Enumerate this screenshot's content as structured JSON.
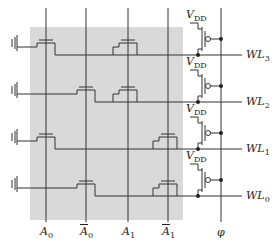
{
  "diagram": {
    "type": "NOR-based address decoder",
    "colors": {
      "shade": "#d9d9d9",
      "wire": "#333333"
    },
    "inputs": [
      {
        "label": "A",
        "sub": "0",
        "bar": false,
        "x": 46
      },
      {
        "label": "A",
        "sub": "0",
        "bar": true,
        "x": 86
      },
      {
        "label": "A",
        "sub": "1",
        "bar": false,
        "x": 128
      },
      {
        "label": "A",
        "sub": "1",
        "bar": true,
        "x": 168
      }
    ],
    "clock": {
      "label": "φ",
      "x": 221
    },
    "supply_label": "V",
    "supply_sub": "DD",
    "word_lines": [
      {
        "label": "WL",
        "sub": "3",
        "y": 55,
        "gates": [
          0,
          2
        ]
      },
      {
        "label": "WL",
        "sub": "2",
        "y": 102,
        "gates": [
          1,
          2
        ]
      },
      {
        "label": "WL",
        "sub": "1",
        "y": 149,
        "gates": [
          0,
          3
        ]
      },
      {
        "label": "WL",
        "sub": "0",
        "y": 196,
        "gates": [
          1,
          3
        ]
      }
    ]
  },
  "labels": {
    "a0": "A",
    "a0_sub": "0",
    "a0b": "A",
    "a0b_sub": "0",
    "a1": "A",
    "a1_sub": "1",
    "a1b": "A",
    "a1b_sub": "1",
    "phi": "φ",
    "vdd": "V",
    "vdd_sub": "DD",
    "wl3": "WL",
    "wl3_sub": "3",
    "wl2": "WL",
    "wl2_sub": "2",
    "wl1": "WL",
    "wl1_sub": "1",
    "wl0": "WL",
    "wl0_sub": "0"
  }
}
